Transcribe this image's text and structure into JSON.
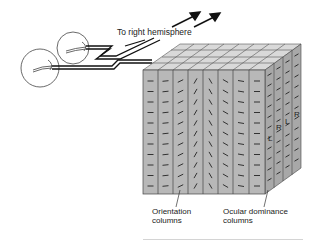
{
  "diagram": {
    "labels": {
      "to_right_hemisphere": "To right hemisphere",
      "orientation_columns_line1": "Orientation",
      "orientation_columns_line2": "columns",
      "ocular_dominance_line1": "Ocular dominance",
      "ocular_dominance_line2": "columns"
    },
    "side_column_letters": [
      "L",
      "R",
      "L",
      "R"
    ],
    "colors": {
      "column_fill": "#b8b8b8",
      "column_top": "#d9d9d9",
      "column_side": "#a8a8a8",
      "stroke": "#333333",
      "divider": "#d4d4d4"
    },
    "front_columns": [
      {
        "angle": 0
      },
      {
        "angle": -5
      },
      {
        "angle": -25
      },
      {
        "angle": -60
      },
      {
        "angle": 60
      },
      {
        "angle": 30
      },
      {
        "angle": 10
      },
      {
        "angle": 0
      }
    ]
  }
}
